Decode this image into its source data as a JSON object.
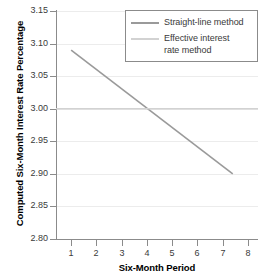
{
  "chart_data": {
    "type": "line",
    "title": "",
    "xlabel": "Six-Month Period",
    "ylabel": "Computed Six-Month Interest Rate Percentage",
    "xlim": [
      0.4,
      8.4
    ],
    "ylim": [
      2.8,
      3.15
    ],
    "grid": true,
    "legend_position": "top-right",
    "x_ticks": [
      "1",
      "2",
      "3",
      "4",
      "5",
      "6",
      "7",
      "8"
    ],
    "x_tick_values": [
      1,
      2,
      3,
      4,
      5,
      6,
      7,
      8
    ],
    "y_ticks": [
      "2.80",
      "2.85",
      "2.90",
      "2.95",
      "3.00",
      "3.05",
      "3.10",
      "3.15"
    ],
    "y_tick_values": [
      2.8,
      2.85,
      2.9,
      2.95,
      3.0,
      3.05,
      3.1,
      3.15
    ],
    "series": [
      {
        "name": "Straight-line method",
        "color": "#9a9a9a",
        "x": [
          1.0,
          7.4
        ],
        "values": [
          3.09,
          2.9
        ]
      },
      {
        "name": "Effective interest\nrate method",
        "color": "#d2d2d2",
        "x": [
          0.4,
          8.4
        ],
        "values": [
          3.0,
          3.0
        ]
      }
    ]
  },
  "legend": {
    "entries": [
      {
        "label": "Straight-line method",
        "color": "#9a9a9a"
      },
      {
        "label": "Effective interest\nrate method",
        "color": "#d2d2d2"
      }
    ]
  },
  "axes": {
    "x_title": "Six-Month Period",
    "y_title": "Computed Six-Month Interest Rate Percentage"
  },
  "colors": {
    "axis": "#8b8b8b",
    "grid": "#ececec",
    "tick_text": "#3a3a3a",
    "title_text": "#000000",
    "background": "#ffffff",
    "series_straight_line": "#9a9a9a",
    "series_effective_rate": "#d2d2d2"
  }
}
